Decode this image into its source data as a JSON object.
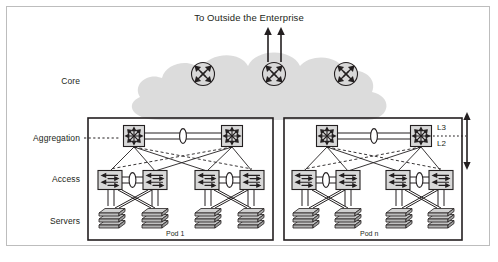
{
  "figure": {
    "title": "To Outside the Enterprise",
    "border_color": "#bdbdbd",
    "background": "#ffffff",
    "width": 498,
    "height": 262
  },
  "palette": {
    "ink": "#231f20",
    "cloud_fill": "#d9d9d9",
    "device_fill": "#dcdcdc",
    "device_stroke": "#231f20",
    "server_top": "#cfcfcf",
    "server_side": "#b8b8b8",
    "pod_border": "#231f20",
    "link": "#231f20",
    "dashed_link": "#231f20"
  },
  "row_labels": [
    {
      "id": "core",
      "label": "Core",
      "x": 70,
      "y": 76
    },
    {
      "id": "aggregation",
      "label": "Aggregation",
      "x": 70,
      "y": 133
    },
    {
      "id": "access",
      "label": "Access",
      "x": 70,
      "y": 174
    },
    {
      "id": "servers",
      "label": "Servers",
      "x": 70,
      "y": 216
    }
  ],
  "layer_markers": [
    {
      "id": "l3",
      "label": "L3",
      "x": 437,
      "y": 127
    },
    {
      "id": "l2",
      "label": "L2",
      "x": 437,
      "y": 143
    }
  ],
  "core": {
    "label": "Core",
    "routers": [
      {
        "id": "core-router-left",
        "cx": 203,
        "cy": 74,
        "r": 12
      },
      {
        "id": "core-router-center",
        "cx": 274,
        "cy": 74,
        "r": 12
      },
      {
        "id": "core-router-right",
        "cx": 346,
        "cy": 74,
        "r": 12
      }
    ],
    "uplinks": [
      {
        "id": "uplink-left",
        "x": 268,
        "y1": 30,
        "y2": 62
      },
      {
        "id": "uplink-right",
        "x": 281,
        "y1": 30,
        "y2": 62
      }
    ],
    "cloud": {
      "id": "enterprise-cloud",
      "fill": "#d9d9d9"
    }
  },
  "pods": [
    {
      "id": "pod-1",
      "label": "Pod 1",
      "x": 88,
      "y": 118,
      "width": 185,
      "height": 122,
      "label_x": 166,
      "label_y": 234,
      "aggregation_switches": [
        {
          "id": "pod1-agg-left",
          "cx": 134,
          "cy": 136
        },
        {
          "id": "pod1-agg-right",
          "cx": 232,
          "cy": 136
        }
      ],
      "access_switches": [
        {
          "id": "pod1-access-1",
          "cx": 110,
          "cy": 180
        },
        {
          "id": "pod1-access-2",
          "cx": 155,
          "cy": 180
        },
        {
          "id": "pod1-access-3",
          "cx": 207,
          "cy": 180
        },
        {
          "id": "pod1-access-4",
          "cx": 252,
          "cy": 180
        }
      ],
      "server_stacks": [
        {
          "id": "pod1-servers-1",
          "cx": 112,
          "cy": 216
        },
        {
          "id": "pod1-servers-2",
          "cx": 155,
          "cy": 216
        },
        {
          "id": "pod1-servers-3",
          "cx": 208,
          "cy": 216
        },
        {
          "id": "pod1-servers-4",
          "cx": 251,
          "cy": 216
        }
      ]
    },
    {
      "id": "pod-n",
      "label": "Pod n",
      "x": 284,
      "y": 118,
      "width": 178,
      "height": 122,
      "label_x": 360,
      "label_y": 234,
      "aggregation_switches": [
        {
          "id": "podn-agg-left",
          "cx": 327,
          "cy": 136
        },
        {
          "id": "podn-agg-right",
          "cx": 421,
          "cy": 136
        }
      ],
      "access_switches": [
        {
          "id": "podn-access-1",
          "cx": 304,
          "cy": 180
        },
        {
          "id": "podn-access-2",
          "cx": 348,
          "cy": 180
        },
        {
          "id": "podn-access-3",
          "cx": 398,
          "cy": 180
        },
        {
          "id": "podn-access-4",
          "cx": 441,
          "cy": 180
        }
      ],
      "server_stacks": [
        {
          "id": "podn-servers-1",
          "cx": 306,
          "cy": 216
        },
        {
          "id": "podn-servers-2",
          "cx": 348,
          "cy": 216
        },
        {
          "id": "podn-servers-3",
          "cx": 399,
          "cy": 216
        },
        {
          "id": "podn-servers-4",
          "cx": 441,
          "cy": 216
        }
      ]
    }
  ],
  "icons": {
    "core_router": "router-icon",
    "aggregation_switch": "multilayer-switch-icon",
    "access_switch": "layer2-switch-icon",
    "server": "server-stack-icon",
    "link_ellipse": "link-ellipse-icon",
    "uplink_arrow": "up-arrow-icon",
    "boundary_arrow": "double-arrow-icon",
    "aggregation_dotted_leader": "dotted-leader-icon"
  }
}
